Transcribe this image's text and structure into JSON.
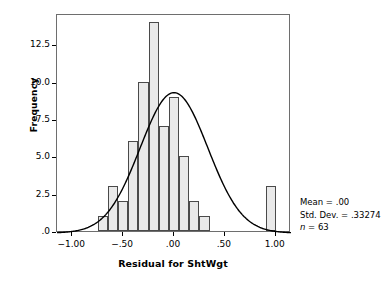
{
  "chart_data": {
    "type": "bar",
    "title": "",
    "subtitle": "",
    "xlabel": "Residual for ShtWgt",
    "ylabel": "Frequency",
    "xlim": [
      -1.15,
      1.15
    ],
    "ylim": [
      0,
      14.6
    ],
    "grid": false,
    "legend": null,
    "bin_width": 0.1,
    "bin_centers": [
      -0.7,
      -0.6,
      -0.5,
      -0.4,
      -0.3,
      -0.2,
      -0.1,
      0.0,
      0.1,
      0.2,
      0.3,
      0.4,
      0.95
    ],
    "bin_left_edges": [
      -0.75,
      -0.65,
      -0.55,
      -0.45,
      -0.35,
      -0.25,
      -0.15,
      -0.05,
      0.05,
      0.15,
      0.25,
      0.35,
      0.9
    ],
    "categories": [
      "-0.70",
      "-0.60",
      "-0.50",
      "-0.40",
      "-0.30",
      "-0.20",
      "-0.10",
      "0.00",
      "0.10",
      "0.20",
      "0.30",
      "0.40",
      "0.95"
    ],
    "values": [
      1,
      3,
      2,
      6,
      10,
      14,
      7,
      9,
      5,
      2,
      1,
      0,
      3
    ],
    "xticks": [
      -1.0,
      -0.5,
      0.0,
      0.5,
      1.0
    ],
    "xtick_labels": [
      "−1.00",
      "−.50",
      ".00",
      ".50",
      "1.00"
    ],
    "yticks": [
      0,
      2.5,
      5.0,
      7.5,
      10.0,
      12.5
    ],
    "ytick_labels": [
      ".0",
      "2.5",
      "5.0",
      "7.5",
      "10.0",
      "12.5"
    ],
    "overlay_curve": {
      "type": "normal",
      "mean": 0.0,
      "sd": 0.33274,
      "n": 63,
      "peak_value": 9.4,
      "color": "#000000"
    },
    "bar_fill_color": "#e9e9e9",
    "bar_edge_color": "#4a4a4a"
  },
  "annotation": {
    "mean_line": "Mean = .00",
    "sd_line": "Std. Dev. = .33274",
    "n_symbol": "n",
    "n_line": " = 63"
  },
  "axes": {
    "x_title": "Residual for ShtWgt",
    "y_title": "Frequency"
  }
}
